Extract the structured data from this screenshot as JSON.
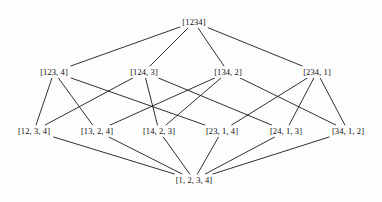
{
  "figure": {
    "background_color": "#fdfdfd",
    "edge_color": "#1a1a1a",
    "text_color": "#101010"
  },
  "chart_data": {
    "type": "diagram",
    "subtype": "hasse-diagram",
    "title": "",
    "xlabel": "",
    "ylabel": "",
    "grid": false,
    "legend": null,
    "levels": [
      {
        "rank": 0,
        "y": 22,
        "node_ids": [
          "n1234"
        ]
      },
      {
        "rank": 1,
        "y": 72,
        "node_ids": [
          "n123_4",
          "n124_3",
          "n134_2",
          "n234_1"
        ]
      },
      {
        "rank": 2,
        "y": 131,
        "node_ids": [
          "n12_3_4",
          "n13_2_4",
          "n14_2_3",
          "n23_1_4",
          "n24_1_3",
          "n34_1_2"
        ]
      },
      {
        "rank": 3,
        "y": 180,
        "node_ids": [
          "n1_2_3_4"
        ]
      }
    ],
    "nodes": [
      {
        "id": "n1234",
        "label": "[1234]",
        "x": 194,
        "y": 22,
        "rank": 0
      },
      {
        "id": "n123_4",
        "label": "[123, 4]",
        "x": 54,
        "y": 72,
        "rank": 1
      },
      {
        "id": "n124_3",
        "label": "[124, 3]",
        "x": 144,
        "y": 72,
        "rank": 1
      },
      {
        "id": "n134_2",
        "label": "[134, 2]",
        "x": 228,
        "y": 72,
        "rank": 1
      },
      {
        "id": "n234_1",
        "label": "[234, 1]",
        "x": 317,
        "y": 72,
        "rank": 1
      },
      {
        "id": "n12_3_4",
        "label": "[12, 3, 4]",
        "x": 34,
        "y": 131,
        "rank": 2
      },
      {
        "id": "n13_2_4",
        "label": "[13, 2, 4]",
        "x": 97,
        "y": 131,
        "rank": 2
      },
      {
        "id": "n14_2_3",
        "label": "[14, 2, 3]",
        "x": 159,
        "y": 131,
        "rank": 2
      },
      {
        "id": "n23_1_4",
        "label": "[23, 1, 4]",
        "x": 222,
        "y": 131,
        "rank": 2
      },
      {
        "id": "n24_1_3",
        "label": "[24, 1, 3]",
        "x": 286,
        "y": 131,
        "rank": 2
      },
      {
        "id": "n34_1_2",
        "label": "[34, 1, 2]",
        "x": 348,
        "y": 131,
        "rank": 2
      },
      {
        "id": "n1_2_3_4",
        "label": "[1, 2, 3, 4]",
        "x": 194,
        "y": 180,
        "rank": 3
      }
    ],
    "edges": [
      {
        "from": "n1234",
        "to": "n123_4"
      },
      {
        "from": "n1234",
        "to": "n124_3"
      },
      {
        "from": "n1234",
        "to": "n134_2"
      },
      {
        "from": "n1234",
        "to": "n234_1"
      },
      {
        "from": "n123_4",
        "to": "n12_3_4"
      },
      {
        "from": "n123_4",
        "to": "n13_2_4"
      },
      {
        "from": "n123_4",
        "to": "n23_1_4"
      },
      {
        "from": "n124_3",
        "to": "n12_3_4"
      },
      {
        "from": "n124_3",
        "to": "n14_2_3"
      },
      {
        "from": "n124_3",
        "to": "n24_1_3"
      },
      {
        "from": "n134_2",
        "to": "n13_2_4"
      },
      {
        "from": "n134_2",
        "to": "n14_2_3"
      },
      {
        "from": "n134_2",
        "to": "n34_1_2"
      },
      {
        "from": "n234_1",
        "to": "n23_1_4"
      },
      {
        "from": "n234_1",
        "to": "n24_1_3"
      },
      {
        "from": "n234_1",
        "to": "n34_1_2"
      },
      {
        "from": "n12_3_4",
        "to": "n1_2_3_4"
      },
      {
        "from": "n13_2_4",
        "to": "n1_2_3_4"
      },
      {
        "from": "n14_2_3",
        "to": "n1_2_3_4"
      },
      {
        "from": "n23_1_4",
        "to": "n1_2_3_4"
      },
      {
        "from": "n24_1_3",
        "to": "n1_2_3_4"
      },
      {
        "from": "n34_1_2",
        "to": "n1_2_3_4"
      }
    ]
  }
}
